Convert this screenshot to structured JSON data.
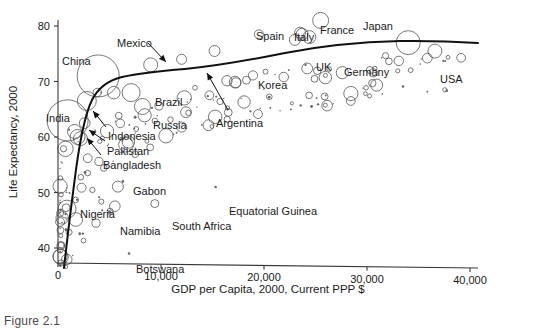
{
  "caption": "Figure 2.1",
  "chart_data": {
    "type": "scatter",
    "title": "",
    "xlabel": "GDP per Capita, 2000, Current PPP $",
    "ylabel": "Life Expectancy, 2000",
    "xlim": [
      0,
      41500
    ],
    "ylim": [
      36,
      82
    ],
    "grid": false,
    "legend": "none",
    "note": "Bubble scatter; bubble area proportional to population. Dark curve is a fitted (lowess) trend line.",
    "xticks": [
      {
        "value": 0,
        "label": "0"
      },
      {
        "value": 10000,
        "label": "10,000"
      },
      {
        "value": 20000,
        "label": "20,000"
      },
      {
        "value": 30000,
        "label": "30,000"
      },
      {
        "value": 40000,
        "label": "40,000"
      }
    ],
    "yticks": [
      {
        "value": 40,
        "label": "40"
      },
      {
        "value": 50,
        "label": "50"
      },
      {
        "value": 60,
        "label": "60"
      },
      {
        "value": 70,
        "label": "70"
      },
      {
        "value": 80,
        "label": "80"
      }
    ],
    "annotations": [
      {
        "label": "China",
        "lx": 62,
        "ly": 55,
        "leader": false
      },
      {
        "label": "Mexico",
        "lx": 117,
        "ly": 37,
        "leader": true,
        "ax1": 148,
        "ay1": 43,
        "ax2": 166,
        "ay2": 62
      },
      {
        "label": "Spain",
        "lx": 256,
        "ly": 30,
        "leader": false
      },
      {
        "label": "Italy",
        "lx": 294,
        "ly": 31,
        "leader": false
      },
      {
        "label": "France",
        "lx": 320,
        "ly": 24,
        "leader": false
      },
      {
        "label": "Japan",
        "lx": 363,
        "ly": 20,
        "leader": false
      },
      {
        "label": "UK",
        "lx": 316,
        "ly": 61,
        "leader": false
      },
      {
        "label": "Germany",
        "lx": 344,
        "ly": 66,
        "leader": false
      },
      {
        "label": "USA",
        "lx": 440,
        "ly": 73,
        "leader": false
      },
      {
        "label": "Korea",
        "lx": 258,
        "ly": 79,
        "leader": false
      },
      {
        "label": "Argentina",
        "lx": 216,
        "ly": 117,
        "leader": true,
        "ax1": 228,
        "ay1": 110,
        "ax2": 207,
        "ay2": 73
      },
      {
        "label": "Brazil",
        "lx": 155,
        "ly": 96,
        "leader": false
      },
      {
        "label": "Russia",
        "lx": 153,
        "ly": 119,
        "leader": false
      },
      {
        "label": "India",
        "lx": 46,
        "ly": 112,
        "leader": false
      },
      {
        "label": "Indonesia",
        "lx": 108,
        "ly": 130,
        "leader": true,
        "ax1": 106,
        "ay1": 127,
        "ax2": 93,
        "ay2": 111
      },
      {
        "label": "Pakistan",
        "lx": 107,
        "ly": 145,
        "leader": true,
        "ax1": 105,
        "ay1": 141,
        "ax2": 89,
        "ay2": 130
      },
      {
        "label": "Bangladesh",
        "lx": 103,
        "ly": 159,
        "leader": true,
        "ax1": 101,
        "ay1": 155,
        "ax2": 87,
        "ay2": 138
      },
      {
        "label": "Gabon",
        "lx": 133,
        "ly": 185,
        "leader": false
      },
      {
        "label": "Nigeria",
        "lx": 80,
        "ly": 208,
        "leader": false
      },
      {
        "label": "Namibia",
        "lx": 120,
        "ly": 225,
        "leader": false
      },
      {
        "label": "South Africa",
        "lx": 172,
        "ly": 220,
        "leader": false
      },
      {
        "label": "Equatorial Guinea",
        "lx": 229,
        "ly": 205,
        "leader": false
      },
      {
        "label": "Botswana",
        "lx": 136,
        "ly": 263,
        "leader": false
      }
    ],
    "points": [
      {
        "x": 930,
        "y": 63.0,
        "r": 20.5,
        "name": "India"
      },
      {
        "x": 3900,
        "y": 71.0,
        "r": 21.0,
        "name": "China"
      },
      {
        "x": 34000,
        "y": 77.0,
        "r": 12.0,
        "name": "USA"
      },
      {
        "x": 2800,
        "y": 66.5,
        "r": 9.5,
        "name": "Indonesia"
      },
      {
        "x": 7100,
        "y": 68.0,
        "r": 9.0,
        "name": "Brazil"
      },
      {
        "x": 8200,
        "y": 65.5,
        "r": 8.0,
        "name": "Russia"
      },
      {
        "x": 1900,
        "y": 60.0,
        "r": 7.5,
        "name": "Pakistan"
      },
      {
        "x": 1600,
        "y": 61.0,
        "r": 7.0,
        "name": "Bangladesh"
      },
      {
        "x": 9000,
        "y": 73.0,
        "r": 7.0,
        "name": "Mexico"
      },
      {
        "x": 25500,
        "y": 81.0,
        "r": 8.0,
        "name": "Japan"
      },
      {
        "x": 24400,
        "y": 78.0,
        "r": 6.5,
        "name": "Germany"
      },
      {
        "x": 23700,
        "y": 78.5,
        "r": 6.0,
        "name": "France"
      },
      {
        "x": 23000,
        "y": 77.5,
        "r": 5.5,
        "name": "UK"
      },
      {
        "x": 23500,
        "y": 78.8,
        "r": 5.5,
        "name": "Italy"
      },
      {
        "x": 19500,
        "y": 78.5,
        "r": 4.5,
        "name": "Spain"
      },
      {
        "x": 15200,
        "y": 75.5,
        "r": 5.5,
        "name": "Korea"
      },
      {
        "x": 12000,
        "y": 74.0,
        "r": 5.0,
        "name": "Argentina"
      },
      {
        "x": 880,
        "y": 47.0,
        "r": 9.0,
        "name": "Nigeria"
      },
      {
        "x": 9400,
        "y": 48.0,
        "r": 4.0,
        "name": "South Africa"
      },
      {
        "x": 6300,
        "y": 52.0,
        "r": 1.3,
        "name": "Gabon"
      },
      {
        "x": 15300,
        "y": 51.0,
        "r": 1.3,
        "name": "Equatorial Guinea"
      },
      {
        "x": 6900,
        "y": 39.0,
        "r": 1.3,
        "name": "Botswana"
      },
      {
        "x": 5000,
        "y": 46.5,
        "r": 1.6,
        "name": "Namibia"
      }
    ]
  }
}
